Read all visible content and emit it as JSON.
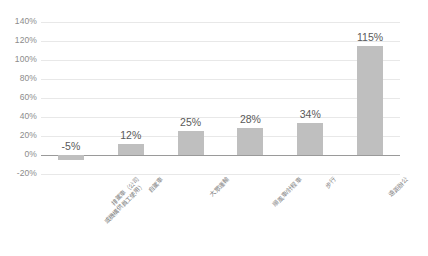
{
  "chart_data": {
    "type": "bar",
    "title": "",
    "subtitle": "",
    "xlabel": "",
    "ylabel": "",
    "grid": true,
    "legend": false,
    "ylim": [
      -20,
      140
    ],
    "ytick_step": 20,
    "yticks": [
      "140%",
      "120%",
      "100%",
      "80%",
      "60%",
      "40%",
      "20%",
      "0%",
      "-20%"
    ],
    "ytick_values": [
      140,
      120,
      100,
      80,
      60,
      40,
      20,
      0,
      -20
    ],
    "categories": [
      "排駕車（公司或機構供員工使用）",
      "自駕車",
      "大眾運輸",
      "順風車/計程車",
      "步行",
      "遠距辦公"
    ],
    "category_lines": [
      [
        "排駕車（公司",
        "或機構供員工使用）"
      ],
      [
        "自駕車"
      ],
      [
        "大眾運輸"
      ],
      [
        "順風車/計程車"
      ],
      [
        "步行"
      ],
      [
        "遠距辦公"
      ]
    ],
    "values": [
      -5,
      12,
      25,
      28,
      34,
      115
    ],
    "data_labels": [
      "-5%",
      "12%",
      "25%",
      "28%",
      "34%",
      "115%"
    ],
    "bar_color": "#bfbfbf",
    "gridline_color": "#e8e8e8",
    "axis_color": "#9a9a9a",
    "tick_label_color": "#8c8c8c",
    "data_label_color": "#595959",
    "background": "#ffffff"
  }
}
